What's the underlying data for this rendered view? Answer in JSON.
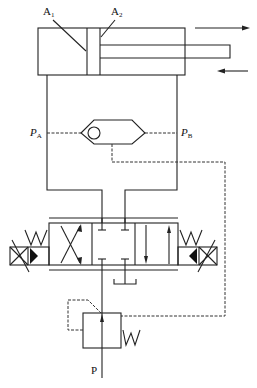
{
  "diagram": {
    "type": "hydraulic-circuit",
    "labels": {
      "a1": {
        "main": "A",
        "sub": "1"
      },
      "a2": {
        "main": "A",
        "sub": "2"
      },
      "pa": {
        "main": "P",
        "sub": "A"
      },
      "pb": {
        "main": "P",
        "sub": "B"
      },
      "p": "P"
    },
    "components": [
      {
        "id": "cylinder",
        "kind": "double-acting-cylinder",
        "chambers": [
          "A1 (cap end)",
          "A2 (rod end)"
        ]
      },
      {
        "id": "direction-arrows",
        "kind": "motion-arrows",
        "directions": [
          "right (extend)",
          "left (retract)"
        ]
      },
      {
        "id": "shuttle-valve",
        "kind": "shuttle-valve",
        "inputs": [
          "PA",
          "PB"
        ]
      },
      {
        "id": "directional-valve",
        "kind": "4/3 solenoid directional valve",
        "center": "closed (all ports blocked)"
      },
      {
        "id": "pressure-reducing-valve",
        "kind": "pilot-controlled pressure valve with spring"
      },
      {
        "id": "supply",
        "kind": "pressure port",
        "label": "P"
      },
      {
        "id": "tank",
        "kind": "tank return"
      }
    ],
    "colors": {
      "line": "#222222",
      "background": "#ffffff"
    }
  }
}
